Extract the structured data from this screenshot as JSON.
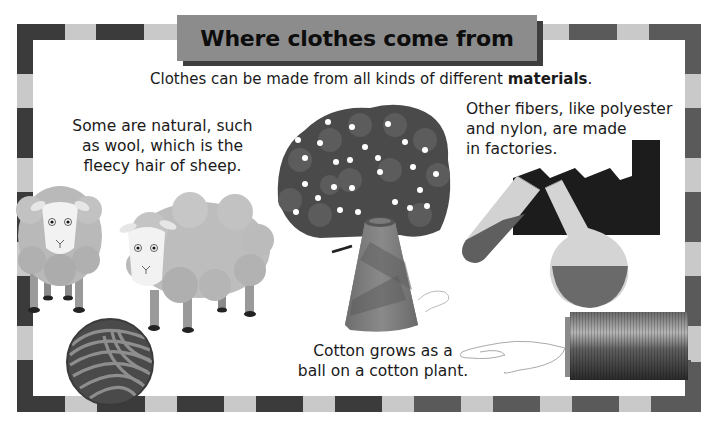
{
  "header": {
    "title": "Where clothes come from"
  },
  "intro": {
    "text_before": "Clothes can be made from all kinds of different ",
    "text_bold": "materials",
    "text_after": "."
  },
  "sections": {
    "natural": {
      "lines": [
        "Some are natural, such",
        "as wool, which is the",
        "fleecy hair of sheep."
      ]
    },
    "synthetic": {
      "lines": [
        "Other fibers, like polyester",
        "and nylon, are made",
        "in factories."
      ]
    },
    "cotton": {
      "lines": [
        "Cotton grows as a",
        "ball on a cotton plant."
      ]
    }
  },
  "illustrations": {
    "sheep": "sheep-icon",
    "yarn_ball": "yarn-ball-icon",
    "cotton_plant": "cotton-plant-icon",
    "cotton_cone": "thread-cone-icon",
    "factory": "factory-icon",
    "test_tube": "test-tube-icon",
    "flask": "flask-icon",
    "thread_spool": "thread-spool-icon"
  },
  "colors": {
    "border_dark": "#3b3b3b",
    "border_light": "#c9c9c9",
    "title_bg": "#8c8c8c",
    "title_shadow": "#3e3e3e"
  }
}
